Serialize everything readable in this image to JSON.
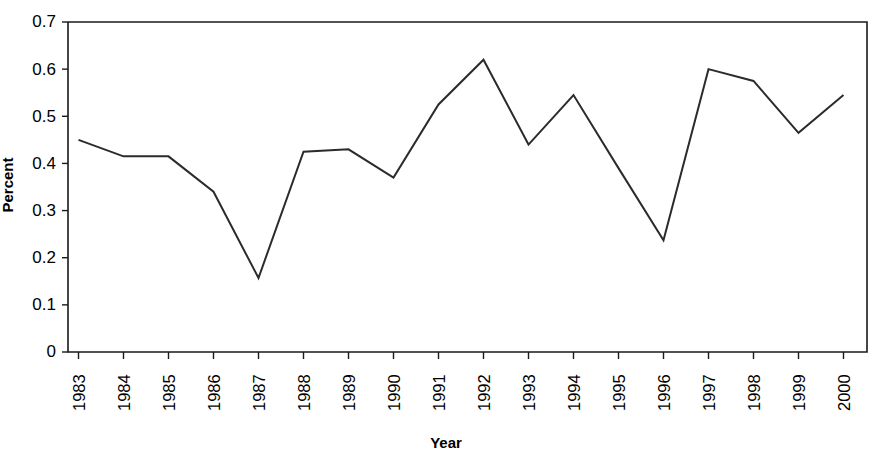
{
  "chart_data": {
    "type": "line",
    "title": "",
    "xlabel": "Year",
    "ylabel": "Percent",
    "categories": [
      "1983",
      "1984",
      "1985",
      "1986",
      "1987",
      "1988",
      "1989",
      "1990",
      "1991",
      "1992",
      "1993",
      "1994",
      "1995",
      "1996",
      "1997",
      "1998",
      "1999",
      "2000"
    ],
    "values": [
      0.45,
      0.415,
      0.415,
      0.34,
      0.157,
      0.425,
      0.43,
      0.37,
      0.525,
      0.62,
      0.44,
      0.545,
      0.39,
      0.237,
      0.6,
      0.575,
      0.465,
      0.545
    ],
    "series": [
      {
        "name": "Percent",
        "values": [
          0.45,
          0.415,
          0.415,
          0.34,
          0.157,
          0.425,
          0.43,
          0.37,
          0.525,
          0.62,
          0.44,
          0.545,
          0.39,
          0.237,
          0.6,
          0.575,
          0.465,
          0.545
        ]
      }
    ],
    "ylim": [
      0,
      0.7
    ],
    "ytick_labels": [
      "0.7",
      "0.6",
      "0.5",
      "0.4",
      "0.3",
      "0.2",
      "0.1",
      "0"
    ],
    "ytick_values": [
      0.7,
      0.6,
      0.5,
      0.4,
      0.3,
      0.2,
      0.1,
      0
    ],
    "grid": false,
    "legend": "none",
    "line_color": "#2b2b2b",
    "axis_color": "#1a1a1a",
    "background_color": "#ffffff",
    "xtick_rotation": -90,
    "ylabel_rotation": -90
  }
}
